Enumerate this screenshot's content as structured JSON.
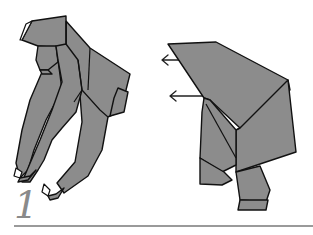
{
  "diagram": {
    "step_number": "1",
    "colors": {
      "paper": "#8c8c8c",
      "outline": "#111111",
      "step_number": "#8a8a8a",
      "rule": "#9a9a9a",
      "background": "#ffffff"
    },
    "arrows": [
      {
        "direction": "left",
        "from": [
          192,
          61
        ],
        "to": [
          160,
          61
        ]
      },
      {
        "direction": "left",
        "from": [
          203,
          96
        ],
        "to": [
          170,
          96
        ]
      }
    ]
  }
}
